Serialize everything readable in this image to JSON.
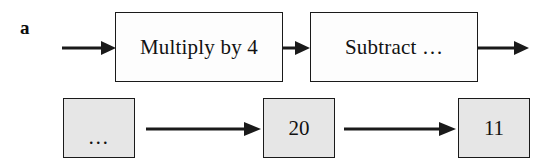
{
  "figure": {
    "panel_label": "a",
    "width": 540,
    "height": 164,
    "background_color": "#ffffff",
    "stroke_color": "#1a1a1a",
    "box_fill_process": "#fdfdfd",
    "box_fill_value": "#e6e6e6"
  },
  "process_row": {
    "boxes": [
      {
        "label": "Multiply by 4",
        "x": 115,
        "y": 12,
        "w": 168,
        "h": 70
      },
      {
        "label": "Subtract …",
        "x": 310,
        "y": 12,
        "w": 168,
        "h": 70
      }
    ],
    "arrows": [
      {
        "name": "input-arrow",
        "x1": 62,
        "y1": 47,
        "x2": 115,
        "y2": 47
      },
      {
        "name": "between-process-arrow",
        "x1": 283,
        "y1": 47,
        "x2": 310,
        "y2": 47
      },
      {
        "name": "output-arrow",
        "x1": 478,
        "y1": 47,
        "x2": 528,
        "y2": 47
      }
    ]
  },
  "value_row": {
    "boxes": [
      {
        "label": "…",
        "x": 63,
        "y": 98,
        "w": 72,
        "h": 60
      },
      {
        "label": "20",
        "x": 263,
        "y": 98,
        "w": 72,
        "h": 60
      },
      {
        "label": "11",
        "x": 458,
        "y": 98,
        "w": 72,
        "h": 60
      }
    ],
    "arrows": [
      {
        "name": "value-arrow-1",
        "x1": 146,
        "y1": 128,
        "x2": 260,
        "y2": 128
      },
      {
        "name": "value-arrow-2",
        "x1": 344,
        "y1": 128,
        "x2": 455,
        "y2": 128
      }
    ]
  }
}
